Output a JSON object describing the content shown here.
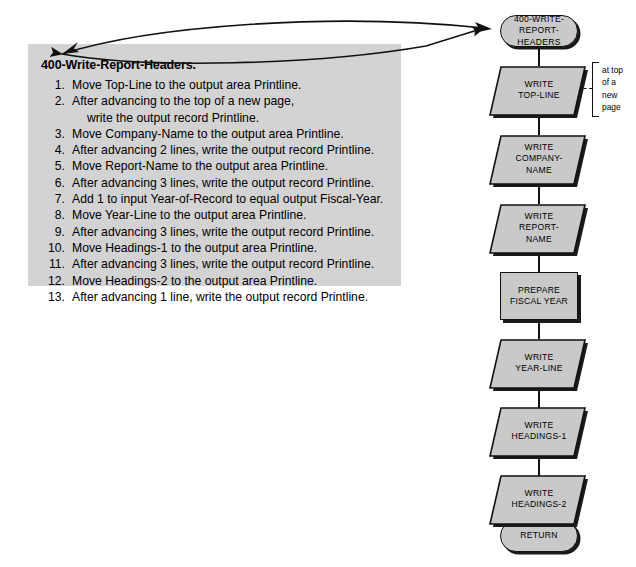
{
  "pseudocode": {
    "title": "400-Write-Report-Headers.",
    "steps": [
      {
        "num": "1.",
        "text": "Move Top-Line to the output area Printline."
      },
      {
        "num": "2.",
        "text": "After advancing to the top of a new page,"
      },
      {
        "num": "",
        "text": "write the output record Printline.",
        "continuation": true
      },
      {
        "num": "3.",
        "text": "Move Company-Name to the output area Printline."
      },
      {
        "num": "4.",
        "text": "After advancing 2 lines, write the output record Printline."
      },
      {
        "num": "5.",
        "text": "Move Report-Name to the output area Printline."
      },
      {
        "num": "6.",
        "text": "After advancing 3 lines, write the output record Printline."
      },
      {
        "num": "7.",
        "text": "Add 1 to input Year-of-Record to equal output Fiscal-Year."
      },
      {
        "num": "8.",
        "text": "Move Year-Line to the output area Printline."
      },
      {
        "num": "9.",
        "text": "After advancing 3 lines, write the output record Printline."
      },
      {
        "num": "10.",
        "text": "Move Headings-1 to the output area Printline."
      },
      {
        "num": "11.",
        "text": "After advancing 3 lines, write the output record Printline."
      },
      {
        "num": "12.",
        "text": "Move Headings-2 to the output area Printline."
      },
      {
        "num": "13.",
        "text": "After advancing 1 line, write the output record Printline."
      }
    ]
  },
  "flowchart": {
    "nodes": [
      {
        "id": "start",
        "shape": "terminal",
        "label": "400-WRITE-\nREPORT-HEADERS"
      },
      {
        "id": "write-top-line",
        "shape": "io",
        "label": "WRITE\nTOP-LINE"
      },
      {
        "id": "write-company",
        "shape": "io",
        "label": "WRITE\nCOMPANY-\nNAME"
      },
      {
        "id": "write-report",
        "shape": "io",
        "label": "WRITE\nREPORT-\nNAME"
      },
      {
        "id": "prepare-fiscal",
        "shape": "process",
        "label": "PREPARE\nFISCAL YEAR"
      },
      {
        "id": "write-year-line",
        "shape": "io",
        "label": "WRITE\nYEAR-LINE"
      },
      {
        "id": "write-headings-1",
        "shape": "io",
        "label": "WRITE\nHEADINGS-1"
      },
      {
        "id": "write-headings-2",
        "shape": "io",
        "label": "WRITE\nHEADINGS-2"
      },
      {
        "id": "return",
        "shape": "terminal",
        "label": "RETURN"
      }
    ],
    "annotation": "at top\nof a\nnew\npage"
  },
  "colors": {
    "panel_fill": "#d3d3d3",
    "shape_fill": "#c9c9c9",
    "outline": "#111111",
    "shadow": "#1a1a1a",
    "page_background": "#ffffff"
  }
}
